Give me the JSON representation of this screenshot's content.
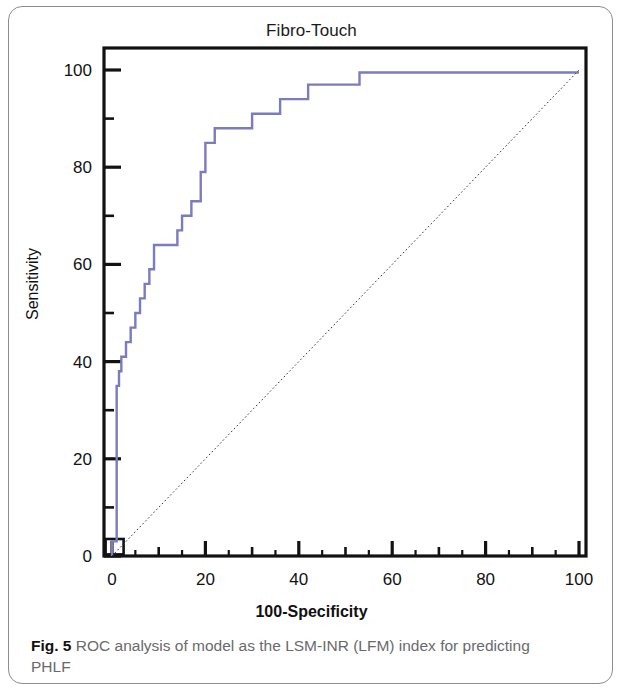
{
  "figure": {
    "caption_label": "Fig. 5",
    "caption_text": " ROC analysis of model as the LSM-INR (LFM) index for predicting PHLF"
  },
  "chart_data": {
    "type": "line",
    "title": "Fibro-Touch",
    "subtitle": "",
    "xlabel": "100-Specificity",
    "ylabel": "Sensitivity",
    "xlim": [
      0,
      100
    ],
    "ylim": [
      0,
      100
    ],
    "grid": false,
    "legend_position": "none",
    "xticks": [
      0,
      20,
      40,
      60,
      80,
      100
    ],
    "xtick_labels": [
      "0",
      "20",
      "40",
      "60",
      "80",
      "100"
    ],
    "xminor_ticks": [
      10,
      30,
      50,
      70,
      90
    ],
    "yticks": [
      0,
      20,
      40,
      60,
      80,
      100
    ],
    "ytick_labels": [
      "0",
      "20",
      "40",
      "60",
      "80",
      "100"
    ],
    "yminor_ticks": [
      10,
      30,
      50,
      70,
      90
    ],
    "annotations": [],
    "series": [
      {
        "name": "ROC curve",
        "color": "#7b7bc0",
        "line_width": 2.4,
        "style": "step",
        "x": [
          0,
          0,
          1,
          1,
          1.5,
          1.5,
          2,
          2,
          2,
          3,
          3,
          4,
          4,
          5,
          5,
          6,
          6,
          7,
          7,
          8,
          8,
          9,
          9,
          14,
          14,
          15,
          15,
          16,
          16,
          17,
          17,
          19,
          19,
          20,
          20,
          21,
          21,
          22,
          22,
          26,
          26,
          30,
          30,
          31,
          31,
          36,
          36,
          41,
          41,
          42,
          42,
          46,
          46,
          53,
          53,
          100
        ],
        "y": [
          0,
          3,
          3,
          35,
          35,
          38,
          38,
          41,
          41,
          41,
          44,
          44,
          47,
          47,
          50,
          50,
          53,
          53,
          56,
          56,
          59,
          59,
          64,
          64,
          67,
          67,
          70,
          70,
          70,
          70,
          73,
          73,
          79,
          79,
          85,
          85,
          85,
          85,
          88,
          88,
          88,
          88,
          91,
          91,
          91,
          91,
          94,
          94,
          94,
          94,
          97,
          97,
          97,
          97,
          99.5,
          99.5
        ]
      },
      {
        "name": "Reference diagonal",
        "color": "#333333",
        "line_width": 1,
        "style": "dotted",
        "x": [
          0,
          100
        ],
        "y": [
          0,
          100
        ]
      }
    ]
  }
}
